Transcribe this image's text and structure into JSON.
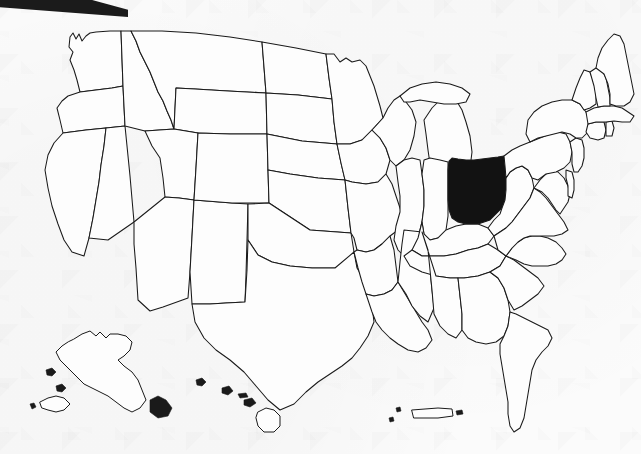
{
  "figure": {
    "kind": "choropleth-locator-map",
    "title": "Map of the United States with Ohio highlighted",
    "width": 641,
    "height": 454,
    "background_color": "#fbfbfb",
    "outline_color": "#1a1a1a",
    "highlight_color": "#121212",
    "state_fill_color": "#fdfdfd",
    "artifact_color": "#1b1b1b"
  },
  "highlight": {
    "state_name": "Ohio",
    "state_code": "OH",
    "fill": "#121212",
    "label": "Ohio"
  },
  "regions": {
    "contiguous_label": "Contiguous United States",
    "insets": [
      {
        "name": "Alaska",
        "code": "AK",
        "highlighted": false
      },
      {
        "name": "Hawaii",
        "code": "HI",
        "highlighted": false
      },
      {
        "name": "Puerto Rico",
        "code": "PR",
        "highlighted": false
      }
    ]
  },
  "states": [
    {
      "code": "WA",
      "name": "Washington",
      "highlighted": false
    },
    {
      "code": "OR",
      "name": "Oregon",
      "highlighted": false
    },
    {
      "code": "CA",
      "name": "California",
      "highlighted": false
    },
    {
      "code": "NV",
      "name": "Nevada",
      "highlighted": false
    },
    {
      "code": "ID",
      "name": "Idaho",
      "highlighted": false
    },
    {
      "code": "MT",
      "name": "Montana",
      "highlighted": false
    },
    {
      "code": "WY",
      "name": "Wyoming",
      "highlighted": false
    },
    {
      "code": "UT",
      "name": "Utah",
      "highlighted": false
    },
    {
      "code": "AZ",
      "name": "Arizona",
      "highlighted": false
    },
    {
      "code": "NM",
      "name": "New Mexico",
      "highlighted": false
    },
    {
      "code": "CO",
      "name": "Colorado",
      "highlighted": false
    },
    {
      "code": "ND",
      "name": "North Dakota",
      "highlighted": false
    },
    {
      "code": "SD",
      "name": "South Dakota",
      "highlighted": false
    },
    {
      "code": "NE",
      "name": "Nebraska",
      "highlighted": false
    },
    {
      "code": "KS",
      "name": "Kansas",
      "highlighted": false
    },
    {
      "code": "OK",
      "name": "Oklahoma",
      "highlighted": false
    },
    {
      "code": "TX",
      "name": "Texas",
      "highlighted": false
    },
    {
      "code": "MN",
      "name": "Minnesota",
      "highlighted": false
    },
    {
      "code": "IA",
      "name": "Iowa",
      "highlighted": false
    },
    {
      "code": "MO",
      "name": "Missouri",
      "highlighted": false
    },
    {
      "code": "AR",
      "name": "Arkansas",
      "highlighted": false
    },
    {
      "code": "LA",
      "name": "Louisiana",
      "highlighted": false
    },
    {
      "code": "WI",
      "name": "Wisconsin",
      "highlighted": false
    },
    {
      "code": "IL",
      "name": "Illinois",
      "highlighted": false
    },
    {
      "code": "MS",
      "name": "Mississippi",
      "highlighted": false
    },
    {
      "code": "MI",
      "name": "Michigan",
      "highlighted": false
    },
    {
      "code": "IN",
      "name": "Indiana",
      "highlighted": false
    },
    {
      "code": "KY",
      "name": "Kentucky",
      "highlighted": false
    },
    {
      "code": "TN",
      "name": "Tennessee",
      "highlighted": false
    },
    {
      "code": "AL",
      "name": "Alabama",
      "highlighted": false
    },
    {
      "code": "OH",
      "name": "Ohio",
      "highlighted": true
    },
    {
      "code": "WV",
      "name": "West Virginia",
      "highlighted": false
    },
    {
      "code": "GA",
      "name": "Georgia",
      "highlighted": false
    },
    {
      "code": "FL",
      "name": "Florida",
      "highlighted": false
    },
    {
      "code": "SC",
      "name": "South Carolina",
      "highlighted": false
    },
    {
      "code": "NC",
      "name": "North Carolina",
      "highlighted": false
    },
    {
      "code": "VA",
      "name": "Virginia",
      "highlighted": false
    },
    {
      "code": "MD",
      "name": "Maryland",
      "highlighted": false
    },
    {
      "code": "DE",
      "name": "Delaware",
      "highlighted": false
    },
    {
      "code": "PA",
      "name": "Pennsylvania",
      "highlighted": false
    },
    {
      "code": "NJ",
      "name": "New Jersey",
      "highlighted": false
    },
    {
      "code": "NY",
      "name": "New York",
      "highlighted": false
    },
    {
      "code": "CT",
      "name": "Connecticut",
      "highlighted": false
    },
    {
      "code": "RI",
      "name": "Rhode Island",
      "highlighted": false
    },
    {
      "code": "MA",
      "name": "Massachusetts",
      "highlighted": false
    },
    {
      "code": "VT",
      "name": "Vermont",
      "highlighted": false
    },
    {
      "code": "NH",
      "name": "New Hampshire",
      "highlighted": false
    },
    {
      "code": "ME",
      "name": "Maine",
      "highlighted": false
    }
  ]
}
